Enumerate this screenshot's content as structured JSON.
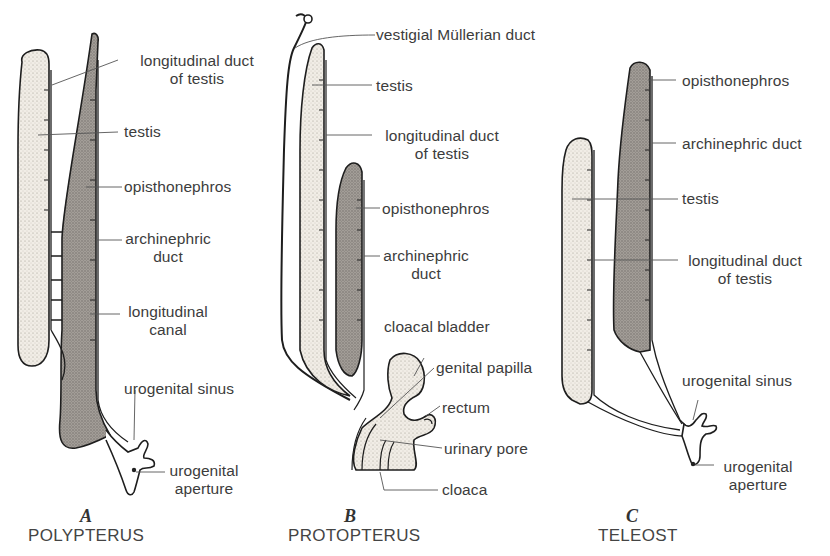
{
  "figure": {
    "colors": {
      "background": "#ffffff",
      "ink": "#222222",
      "light_stipple": "#ece7de",
      "dark_stipple": "#9a9590",
      "label": "#3c3c3c"
    },
    "panels": [
      {
        "letter": "A",
        "name": "POLYPTERUS",
        "labels": [
          {
            "id": "long_duct",
            "line1": "longitudinal duct",
            "line2": "of testis"
          },
          {
            "id": "testis",
            "line1": "testis"
          },
          {
            "id": "opisthonephros",
            "line1": "opisthonephros"
          },
          {
            "id": "archinephric",
            "line1": "archinephric",
            "line2": "duct"
          },
          {
            "id": "long_canal",
            "line1": "longitudinal",
            "line2": "canal"
          },
          {
            "id": "ug_sinus",
            "line1": "urogenital sinus"
          },
          {
            "id": "ug_aperture",
            "line1": "urogenital",
            "line2": "aperture"
          }
        ]
      },
      {
        "letter": "B",
        "name": "PROTOPTERUS",
        "labels": [
          {
            "id": "mullerian",
            "line1": "vestigial Müllerian duct"
          },
          {
            "id": "testis",
            "line1": "testis"
          },
          {
            "id": "long_duct",
            "line1": "longitudinal duct",
            "line2": "of testis"
          },
          {
            "id": "opisthonephros",
            "line1": "opisthonephros"
          },
          {
            "id": "archinephric",
            "line1": "archinephric",
            "line2": "duct"
          },
          {
            "id": "cloacal_bladder",
            "line1": "cloacal bladder"
          },
          {
            "id": "genital_papilla",
            "line1": "genital papilla"
          },
          {
            "id": "rectum",
            "line1": "rectum"
          },
          {
            "id": "urinary_pore",
            "line1": "urinary pore"
          },
          {
            "id": "cloaca",
            "line1": "cloaca"
          }
        ]
      },
      {
        "letter": "C",
        "name": "TELEOST",
        "labels": [
          {
            "id": "opisthonephros",
            "line1": "opisthonephros"
          },
          {
            "id": "archinephric",
            "line1": "archinephric duct"
          },
          {
            "id": "testis",
            "line1": "testis"
          },
          {
            "id": "long_duct",
            "line1": "longitudinal duct",
            "line2": "of testis"
          },
          {
            "id": "ug_sinus",
            "line1": "urogenital sinus"
          },
          {
            "id": "ug_aperture",
            "line1": "urogenital",
            "line2": "aperture"
          }
        ]
      }
    ]
  }
}
